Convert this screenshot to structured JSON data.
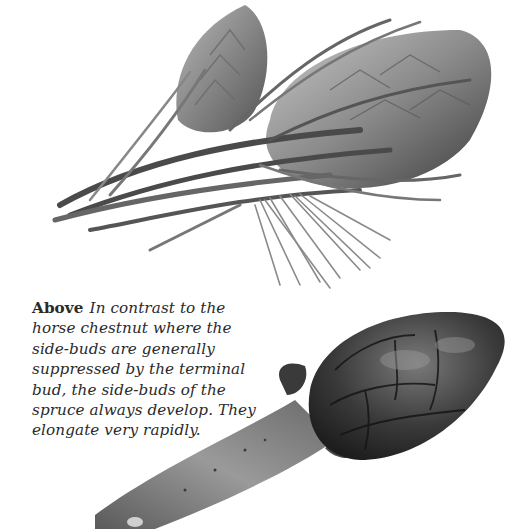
{
  "page": {
    "background": "#ffffff",
    "figures": [
      {
        "id": "spruce-bud",
        "description": "Illustration of spruce shoot with terminal and side-buds surrounded by needles",
        "tone": "grayscale"
      },
      {
        "id": "horse-chestnut-bud",
        "description": "Illustration of a horse chestnut twig with large scaled terminal bud",
        "tone": "grayscale"
      }
    ],
    "caption": {
      "lead": "Above",
      "text": "In contrast to the horse chestnut where the side-buds are generally suppressed by the terminal bud, the side-buds of the spruce always develop. They elongate very rapidly."
    }
  }
}
